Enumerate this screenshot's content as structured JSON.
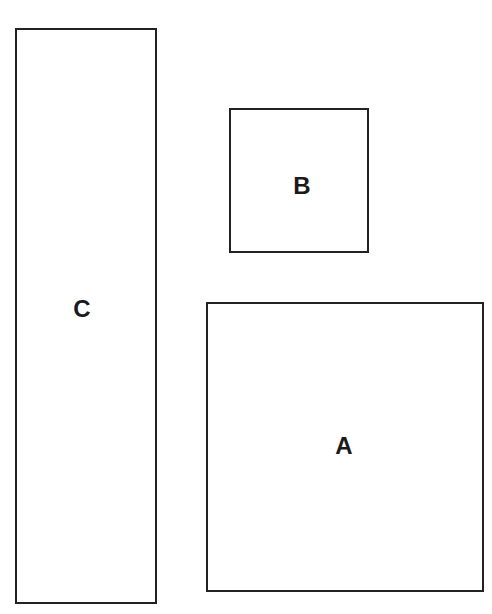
{
  "diagram": {
    "shapes": [
      {
        "id": "C",
        "label": "C",
        "x": 15,
        "y": 28,
        "w": 142,
        "h": 576
      },
      {
        "id": "B",
        "label": "B",
        "x": 229,
        "y": 108,
        "w": 140,
        "h": 145
      },
      {
        "id": "A",
        "label": "A",
        "x": 206,
        "y": 302,
        "w": 278,
        "h": 290
      }
    ],
    "stroke_color": "#222222"
  }
}
